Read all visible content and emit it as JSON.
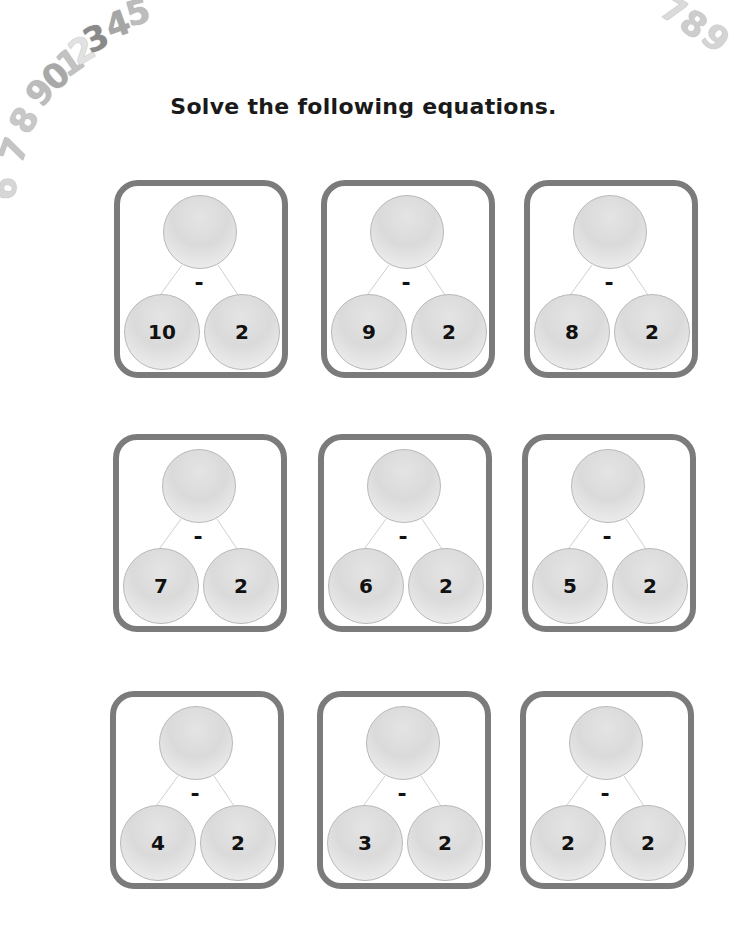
{
  "title": "Solve the following equations.",
  "decoration": {
    "left_arc_digits": [
      "6",
      "7",
      "8",
      "9",
      "0",
      "1",
      "2",
      "3",
      "4",
      "5"
    ],
    "right_arc_digits": [
      "7",
      "8",
      "9"
    ]
  },
  "operator": "-",
  "problems": [
    {
      "top": "",
      "left": "10",
      "right": "2"
    },
    {
      "top": "",
      "left": "9",
      "right": "2"
    },
    {
      "top": "",
      "left": "8",
      "right": "2"
    },
    {
      "top": "",
      "left": "7",
      "right": "2"
    },
    {
      "top": "",
      "left": "6",
      "right": "2"
    },
    {
      "top": "",
      "left": "5",
      "right": "2"
    },
    {
      "top": "",
      "left": "4",
      "right": "2"
    },
    {
      "top": "",
      "left": "3",
      "right": "2"
    },
    {
      "top": "",
      "left": "2",
      "right": "2"
    }
  ],
  "colors": {
    "box_border": "#7b7b7b",
    "circle_fill": "#dedede",
    "text": "#111111"
  }
}
